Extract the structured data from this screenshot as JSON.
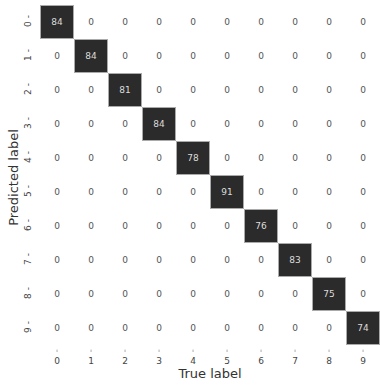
{
  "chart_data": {
    "type": "heatmap",
    "title": "",
    "xlabel": "True label",
    "ylabel": "Predicted label",
    "x_ticks": [
      "0",
      "1",
      "2",
      "3",
      "4",
      "5",
      "6",
      "7",
      "8",
      "9"
    ],
    "y_ticks": [
      "0",
      "1",
      "2",
      "3",
      "4",
      "5",
      "6",
      "7",
      "8",
      "9"
    ],
    "matrix": [
      [
        84,
        0,
        0,
        0,
        0,
        0,
        0,
        0,
        0,
        0
      ],
      [
        0,
        84,
        0,
        0,
        0,
        0,
        0,
        0,
        0,
        0
      ],
      [
        0,
        0,
        81,
        0,
        0,
        0,
        0,
        0,
        0,
        0
      ],
      [
        0,
        0,
        0,
        84,
        0,
        0,
        0,
        0,
        0,
        0
      ],
      [
        0,
        0,
        0,
        0,
        78,
        0,
        0,
        0,
        0,
        0
      ],
      [
        0,
        0,
        0,
        0,
        0,
        91,
        0,
        0,
        0,
        0
      ],
      [
        0,
        0,
        0,
        0,
        0,
        0,
        76,
        0,
        0,
        0
      ],
      [
        0,
        0,
        0,
        0,
        0,
        0,
        0,
        83,
        0,
        0
      ],
      [
        0,
        0,
        0,
        0,
        0,
        0,
        0,
        0,
        75,
        0
      ],
      [
        0,
        0,
        0,
        0,
        0,
        0,
        0,
        0,
        0,
        74
      ]
    ],
    "colormap": "white-to-dark-gray",
    "colorbar": false
  }
}
